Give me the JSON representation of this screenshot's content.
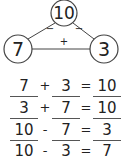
{
  "number_bond": {
    "whole": "10",
    "part_left": "7",
    "part_right": "3",
    "label_left_edge": "−",
    "label_right_edge": "−",
    "label_bottom_edge": "+"
  },
  "equations": [
    {
      "a": "7",
      "op": "+",
      "b": "3",
      "eq": "=",
      "c": "10"
    },
    {
      "a": "3",
      "op": "+",
      "b": "7",
      "eq": "=",
      "c": "10"
    },
    {
      "a": "10",
      "op": "-",
      "b": "7",
      "eq": "=",
      "c": "3"
    },
    {
      "a": "10",
      "op": "-",
      "b": "3",
      "eq": "=",
      "c": "7"
    }
  ]
}
